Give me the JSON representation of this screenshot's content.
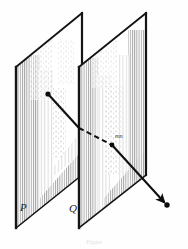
{
  "figure": {
    "kind": "geometry-diagram",
    "labels": {
      "plane_p": "P",
      "plane_q": "Q",
      "segment": "mn"
    },
    "caption": "Figure",
    "colors": {
      "ink": "#101010",
      "paper": "#fefefe",
      "hatch": "#9a9a9a",
      "caption": "#e2e2e2"
    },
    "planes": [
      {
        "name": "P",
        "label": "P",
        "label_x": 20,
        "label_y": 211,
        "corners": "82,13 16,67 16,228 82,175",
        "top_edge": "16,67 82,13",
        "bottom_edge": "16,228 82,175",
        "left_edge": "16,67 16,228",
        "right_edge": "82,13 82,175"
      },
      {
        "name": "Q",
        "label": "Q",
        "label_x": 69,
        "label_y": 212,
        "corners": "146,13 79,67 79,228 146,175",
        "top_edge": "79,67 146,13",
        "bottom_edge": "79,228 146,175",
        "left_edge": "79,67 79,228",
        "right_edge": "146,13 146,175"
      }
    ],
    "ray": {
      "start_point": {
        "x": 48,
        "y": 94,
        "marker": "dot"
      },
      "pierce_p": {
        "x": 79,
        "y": 128
      },
      "pierce_q": {
        "x": 112,
        "y": 145,
        "marker": "dot"
      },
      "end_point": {
        "x": 167,
        "y": 205,
        "marker": "dot"
      },
      "arrow_head_at": "end_point",
      "hidden_portion": "between planes P and Q",
      "segment_label_x": 115,
      "segment_label_y": 138
    },
    "caption_x": 94,
    "caption_y": 244
  }
}
